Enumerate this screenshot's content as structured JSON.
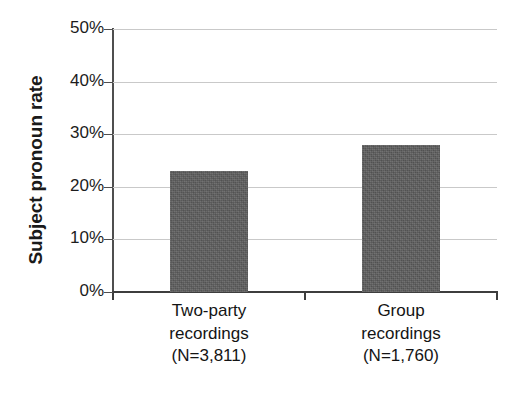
{
  "chart_data": {
    "type": "bar",
    "title": "",
    "subtitle": "",
    "xlabel": "",
    "ylabel": "Subject pronoun rate",
    "categories": [
      "Two-party recordings",
      "Group recordings"
    ],
    "category_lines": [
      [
        "Two-party",
        "recordings",
        "(N=3,811)"
      ],
      [
        "Group",
        "recordings",
        "(N=1,760)"
      ]
    ],
    "values": [
      23,
      28
    ],
    "value_labels": [
      "23%",
      "28%"
    ],
    "sample_sizes": [
      3811,
      1760
    ],
    "ylim": [
      0,
      50
    ],
    "ytick_values": [
      50,
      40,
      30,
      20,
      10,
      0
    ],
    "ytick_labels": [
      "50%",
      "40%",
      "30%",
      "20%",
      "10%",
      "0%"
    ],
    "units": "percent",
    "grid": "horizontal",
    "legend": "none",
    "bar_color": "#5e5e5e",
    "gridline_color": "#c9c9c9",
    "axis_color": "#3d3d3d",
    "text_color": "#141414",
    "background_color": "#ffffff"
  }
}
